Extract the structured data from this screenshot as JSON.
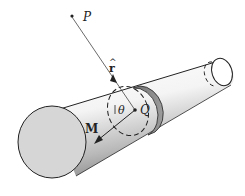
{
  "diagram": {
    "labels": {
      "point_p": "P",
      "point_q": "Q",
      "unit_vector": "r̂",
      "unit_vector_base": "r",
      "unit_vector_hat": "^",
      "angle": "θ",
      "magnetization": "M"
    },
    "colors": {
      "stroke": "#222222",
      "end_face": "#d4d4d4",
      "band": "#8a8a8a",
      "body_light": "#ffffff",
      "body_dark": "#9a9a9a",
      "thin_line": "#555555"
    }
  }
}
